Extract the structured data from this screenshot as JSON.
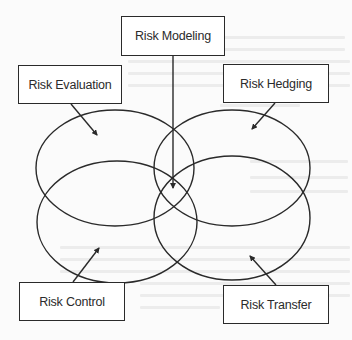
{
  "diagram": {
    "nodes": {
      "modeling": {
        "label": "Risk Modeling"
      },
      "evaluation": {
        "label": "Risk Evaluation"
      },
      "hedging": {
        "label": "Risk Hedging"
      },
      "control": {
        "label": "Risk Control"
      },
      "transfer": {
        "label": "Risk Transfer"
      }
    },
    "regions": [
      {
        "id": "evaluation-region",
        "position": "top-left"
      },
      {
        "id": "hedging-region",
        "position": "top-right"
      },
      {
        "id": "control-region",
        "position": "bottom-left"
      },
      {
        "id": "transfer-region",
        "position": "bottom-right"
      }
    ],
    "edges": [
      {
        "from": "modeling",
        "to": "center-overlap",
        "style": "arrow"
      },
      {
        "from": "evaluation",
        "to": "evaluation-region",
        "style": "arrow"
      },
      {
        "from": "hedging",
        "to": "hedging-region",
        "style": "arrow"
      },
      {
        "from": "control",
        "to": "control-region",
        "style": "arrow"
      },
      {
        "from": "transfer",
        "to": "transfer-region",
        "style": "arrow"
      }
    ],
    "colors": {
      "stroke": "#2a2a2a",
      "box_fill": "#ffffff",
      "text": "#2b2b2b",
      "background": "#fbfbfb"
    }
  }
}
